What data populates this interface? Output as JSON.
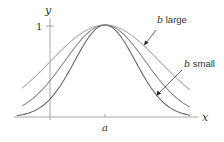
{
  "axes": {
    "x_label": "x",
    "y_label": "y",
    "y_tick_label": "1",
    "x_tick_label": "a"
  },
  "annotations": {
    "large": {
      "var": "b",
      "text": " large"
    },
    "small": {
      "var": "b",
      "text": " small"
    }
  },
  "colors": {
    "axis": "#a8a8a8",
    "curve_large": "#b0b0b0",
    "curve_mid": "#8c8c8c",
    "curve_small": "#6a6a6a",
    "text": "#333333"
  },
  "chart_data": {
    "type": "line",
    "title": "",
    "xlabel": "x",
    "ylabel": "y",
    "series": [
      {
        "name": "b large",
        "width_px": 77
      },
      {
        "name": "b medium",
        "width_px": 57
      },
      {
        "name": "b small",
        "width_px": 43
      }
    ],
    "peak": {
      "x": "a",
      "y": 1
    },
    "ylim": [
      0,
      1
    ],
    "grid": false
  }
}
